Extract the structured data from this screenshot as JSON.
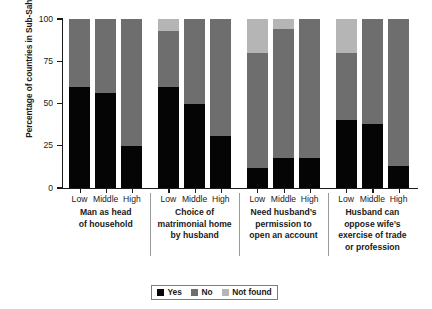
{
  "chart_data": {
    "type": "bar",
    "subtype": "stacked-bar-grouped",
    "title": "",
    "xlabel": "",
    "ylabel": "Percentage of countries in Sub-Saharan Africa",
    "ylim": [
      0,
      100
    ],
    "yticks": [
      0,
      25,
      50,
      75,
      100
    ],
    "ytick_labels": [
      "0",
      "25",
      "50",
      "75",
      "100"
    ],
    "grid": false,
    "legend_position": "bottom-center",
    "categories": [
      "Low",
      "Middle",
      "High"
    ],
    "legend": [
      "Yes",
      "No",
      "Not found"
    ],
    "colors": {
      "Yes": "#050505",
      "No": "#6e6e6e",
      "Not found": "#b5b5b5",
      "axis": "#1a1a1a",
      "background": "#ffffff"
    },
    "groups": [
      {
        "label": "Man as head of household",
        "label_lines": [
          "Man as head",
          "of household"
        ],
        "bars": [
          {
            "category": "Low",
            "Yes": 60,
            "No": 40,
            "Not found": 0
          },
          {
            "category": "Middle",
            "Yes": 56,
            "No": 44,
            "Not found": 0
          },
          {
            "category": "High",
            "Yes": 25,
            "No": 75,
            "Not found": 0
          }
        ]
      },
      {
        "label": "Choice of matrimonial home by husband",
        "label_lines": [
          "Choice of",
          "matrimonial home",
          "by husband"
        ],
        "bars": [
          {
            "category": "Low",
            "Yes": 60,
            "No": 33,
            "Not found": 7
          },
          {
            "category": "Middle",
            "Yes": 50,
            "No": 50,
            "Not found": 0
          },
          {
            "category": "High",
            "Yes": 31,
            "No": 69,
            "Not found": 0
          }
        ]
      },
      {
        "label": "Need husband's permission to open an account",
        "label_lines": [
          "Need husband’s",
          "permission to",
          "open an account"
        ],
        "bars": [
          {
            "category": "Low",
            "Yes": 12,
            "No": 68,
            "Not found": 20
          },
          {
            "category": "Middle",
            "Yes": 18,
            "No": 76,
            "Not found": 6
          },
          {
            "category": "High",
            "Yes": 18,
            "No": 82,
            "Not found": 0
          }
        ]
      },
      {
        "label": "Husband can oppose wife's exercise of trade or profession",
        "label_lines": [
          "Husband can",
          "oppose wife’s",
          "exercise of trade",
          "or profession"
        ],
        "bars": [
          {
            "category": "Low",
            "Yes": 40,
            "No": 40,
            "Not found": 20
          },
          {
            "category": "Middle",
            "Yes": 38,
            "No": 62,
            "Not found": 0
          },
          {
            "category": "High",
            "Yes": 13,
            "No": 87,
            "Not found": 0
          }
        ]
      }
    ]
  }
}
